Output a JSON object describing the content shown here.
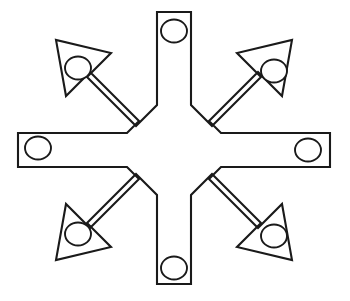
{
  "figure": {
    "title": "Eight-armed star bracket",
    "description": "Line drawing of an eight-pointed star-shaped flat bracket with a round hole near the tip of each arm.",
    "background_color": "#ffffff",
    "stroke_color": "#1a1a1a",
    "fill_color": "#ffffff",
    "stroke_width": 2.1,
    "center": {
      "x": 174,
      "y": 150
    },
    "arm_count": 8,
    "hole_count": 8,
    "canvas": {
      "width": 350,
      "height": 301
    }
  },
  "geometry": {
    "inner_notch_radius": 52,
    "arm_half_width": 18,
    "orthogonal_arm_length": 139,
    "diagonal_arm_length": 142,
    "hole_radius": 12.5,
    "hole_offset_from_tip": 26
  },
  "arms": [
    {
      "name": "arm-north",
      "direction": "north",
      "angle_deg": 90,
      "tip_style": "flat",
      "hole": {
        "cx": 174,
        "cy": 31,
        "r": 12.5
      }
    },
    {
      "name": "arm-northeast",
      "direction": "northeast",
      "angle_deg": 45,
      "tip_style": "chamfered",
      "hole": {
        "cx": 274,
        "cy": 71,
        "r": 12.5
      }
    },
    {
      "name": "arm-east",
      "direction": "east",
      "angle_deg": 0,
      "tip_style": "flat",
      "hole": {
        "cx": 308,
        "cy": 150,
        "r": 12.5
      }
    },
    {
      "name": "arm-southeast",
      "direction": "southeast",
      "angle_deg": -45,
      "tip_style": "chamfered",
      "hole": {
        "cx": 274,
        "cy": 236,
        "r": 12.5
      }
    },
    {
      "name": "arm-south",
      "direction": "south",
      "angle_deg": -90,
      "tip_style": "flat",
      "hole": {
        "cx": 174,
        "cy": 268,
        "r": 12.5
      }
    },
    {
      "name": "arm-southwest",
      "direction": "southwest",
      "angle_deg": -135,
      "tip_style": "chamfered",
      "hole": {
        "cx": 78,
        "cy": 234,
        "r": 12.5
      }
    },
    {
      "name": "arm-west",
      "direction": "west",
      "angle_deg": 180,
      "tip_style": "flat",
      "hole": {
        "cx": 38,
        "cy": 148,
        "r": 12.5
      }
    },
    {
      "name": "arm-northwest",
      "direction": "northwest",
      "angle_deg": 135,
      "tip_style": "chamfered",
      "hole": {
        "cx": 78,
        "cy": 68,
        "r": 12.5
      }
    }
  ]
}
